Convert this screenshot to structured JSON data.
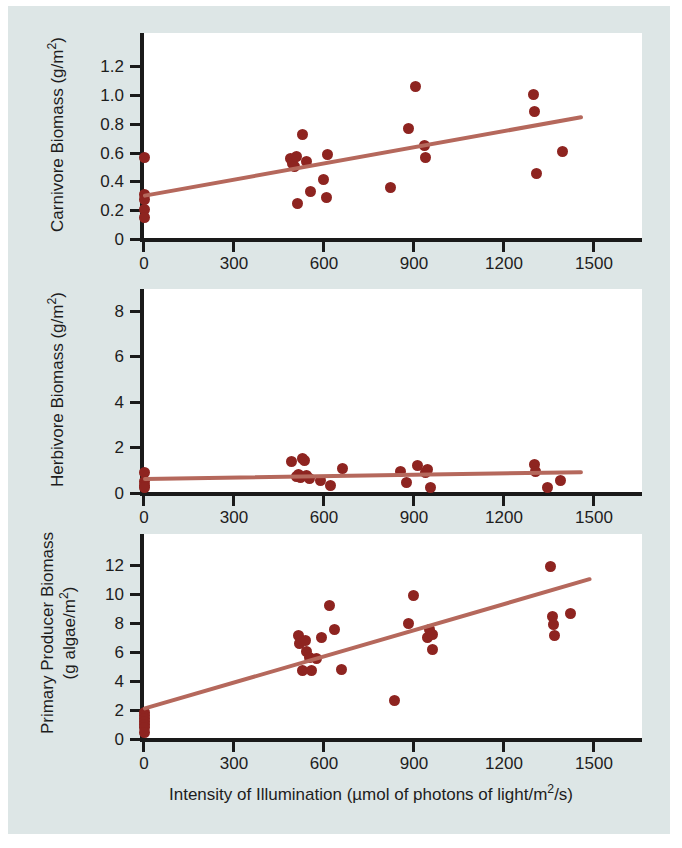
{
  "figure": {
    "background_color": "#dde6e6",
    "plot_background_color": "#ffffff",
    "point_color": "#8e2420",
    "line_color": "#b5685c",
    "axis_color": "#1a1a1a"
  },
  "xaxis": {
    "label_prefix": "Intensity of Illumination (",
    "label_mu": "µ",
    "label_mid": "mol of photons of light/m",
    "label_sup": "2",
    "label_suffix": "/s)",
    "full_label": "Intensity of Illumination (µmol of photons of light/m2/s)",
    "ticks": [
      "0",
      "300",
      "600",
      "900",
      "1200",
      "1500"
    ],
    "min": 0,
    "max": 1560
  },
  "chart_data": [
    {
      "type": "scatter",
      "panel": "top",
      "title": "",
      "ylabel_main": "Carnivore Biomass (g/m",
      "ylabel_sup": "2",
      "ylabel_end": ")",
      "ylabel": "Carnivore Biomass (g/m2)",
      "xlabel": "Intensity of Illumination (µmol of photons of light/m2/s)",
      "yticks": [
        "1.2",
        "1.0",
        "0.8",
        "0.6",
        "0.4",
        "0.2",
        "0"
      ],
      "ytickvals": [
        1.2,
        1.0,
        0.8,
        0.6,
        0.4,
        0.2,
        0
      ],
      "ylim": [
        0,
        1.3
      ],
      "xlim": [
        0,
        1560
      ],
      "grid": false,
      "legend": null,
      "points": [
        {
          "x": 5,
          "y": 0.56
        },
        {
          "x": 5,
          "y": 0.3
        },
        {
          "x": 5,
          "y": 0.27
        },
        {
          "x": 5,
          "y": 0.2
        },
        {
          "x": 5,
          "y": 0.14
        },
        {
          "x": 492,
          "y": 0.55
        },
        {
          "x": 500,
          "y": 0.52
        },
        {
          "x": 505,
          "y": 0.5
        },
        {
          "x": 512,
          "y": 0.57
        },
        {
          "x": 516,
          "y": 0.24
        },
        {
          "x": 532,
          "y": 0.72
        },
        {
          "x": 545,
          "y": 0.53
        },
        {
          "x": 560,
          "y": 0.32
        },
        {
          "x": 604,
          "y": 0.41
        },
        {
          "x": 612,
          "y": 0.28
        },
        {
          "x": 618,
          "y": 0.58
        },
        {
          "x": 828,
          "y": 0.35
        },
        {
          "x": 888,
          "y": 0.76
        },
        {
          "x": 910,
          "y": 1.05
        },
        {
          "x": 940,
          "y": 0.64
        },
        {
          "x": 944,
          "y": 0.56
        },
        {
          "x": 1305,
          "y": 1.0
        },
        {
          "x": 1310,
          "y": 0.88
        },
        {
          "x": 1315,
          "y": 0.45
        },
        {
          "x": 1402,
          "y": 0.6
        }
      ],
      "trendline": {
        "x1": 0,
        "y1": 0.29,
        "x2": 1470,
        "y2": 0.84
      }
    },
    {
      "type": "scatter",
      "panel": "middle",
      "title": "",
      "ylabel_main": "Herbivore Biomass (g/m",
      "ylabel_sup": "2",
      "ylabel_end": ")",
      "ylabel": "Herbivore Biomass (g/m2)",
      "xlabel": "Intensity of Illumination (µmol of photons of light/m2/s)",
      "yticks": [
        "8",
        "6",
        "4",
        "2",
        "0"
      ],
      "ytickvals": [
        8,
        6,
        4,
        2,
        0
      ],
      "ylim": [
        0,
        9.2
      ],
      "xlim": [
        0,
        1560
      ],
      "grid": false,
      "legend": null,
      "points": [
        {
          "x": 5,
          "y": 0.85
        },
        {
          "x": 5,
          "y": 0.45
        },
        {
          "x": 5,
          "y": 0.3
        },
        {
          "x": 5,
          "y": 0.18
        },
        {
          "x": 497,
          "y": 1.35
        },
        {
          "x": 512,
          "y": 0.7
        },
        {
          "x": 520,
          "y": 0.78
        },
        {
          "x": 528,
          "y": 0.65
        },
        {
          "x": 534,
          "y": 1.48
        },
        {
          "x": 540,
          "y": 1.4
        },
        {
          "x": 548,
          "y": 0.72
        },
        {
          "x": 556,
          "y": 0.6
        },
        {
          "x": 592,
          "y": 0.52
        },
        {
          "x": 625,
          "y": 0.3
        },
        {
          "x": 668,
          "y": 1.05
        },
        {
          "x": 862,
          "y": 0.88
        },
        {
          "x": 882,
          "y": 0.4
        },
        {
          "x": 918,
          "y": 1.15
        },
        {
          "x": 944,
          "y": 0.85
        },
        {
          "x": 952,
          "y": 1.0
        },
        {
          "x": 962,
          "y": 0.2
        },
        {
          "x": 1308,
          "y": 1.2
        },
        {
          "x": 1312,
          "y": 0.9
        },
        {
          "x": 1352,
          "y": 0.18
        },
        {
          "x": 1395,
          "y": 0.52
        }
      ],
      "trendline": {
        "x1": 0,
        "y1": 0.58,
        "x2": 1470,
        "y2": 0.88
      }
    },
    {
      "type": "scatter",
      "panel": "bottom",
      "title": "",
      "ylabel_line1": "Primary Producer Biomass",
      "ylabel_line2_main": "(g algae/m",
      "ylabel_sup": "2",
      "ylabel_end": ")",
      "ylabel": "Primary Producer Biomass (g algae/m2)",
      "xlabel": "Intensity of Illumination (µmol of photons of light/m2/s)",
      "yticks": [
        "12",
        "10",
        "8",
        "6",
        "4",
        "2",
        "0"
      ],
      "ytickvals": [
        12,
        10,
        8,
        6,
        4,
        2,
        0
      ],
      "ylim": [
        0,
        13.2
      ],
      "xlim": [
        0,
        1560
      ],
      "grid": false,
      "legend": null,
      "points": [
        {
          "x": 5,
          "y": 1.75
        },
        {
          "x": 5,
          "y": 1.55
        },
        {
          "x": 5,
          "y": 1.35
        },
        {
          "x": 5,
          "y": 1.15
        },
        {
          "x": 5,
          "y": 0.95
        },
        {
          "x": 5,
          "y": 0.75
        },
        {
          "x": 5,
          "y": 0.4
        },
        {
          "x": 518,
          "y": 7.05
        },
        {
          "x": 524,
          "y": 6.55
        },
        {
          "x": 532,
          "y": 4.65
        },
        {
          "x": 544,
          "y": 6.7
        },
        {
          "x": 548,
          "y": 5.95
        },
        {
          "x": 556,
          "y": 5.55
        },
        {
          "x": 562,
          "y": 4.65
        },
        {
          "x": 580,
          "y": 5.5
        },
        {
          "x": 598,
          "y": 6.95
        },
        {
          "x": 622,
          "y": 9.15
        },
        {
          "x": 640,
          "y": 7.5
        },
        {
          "x": 664,
          "y": 4.7
        },
        {
          "x": 840,
          "y": 2.6
        },
        {
          "x": 886,
          "y": 7.9
        },
        {
          "x": 904,
          "y": 9.85
        },
        {
          "x": 952,
          "y": 6.9
        },
        {
          "x": 958,
          "y": 7.5
        },
        {
          "x": 966,
          "y": 7.15
        },
        {
          "x": 968,
          "y": 6.1
        },
        {
          "x": 1362,
          "y": 11.8
        },
        {
          "x": 1368,
          "y": 8.35
        },
        {
          "x": 1372,
          "y": 7.85
        },
        {
          "x": 1376,
          "y": 7.05
        },
        {
          "x": 1428,
          "y": 8.6
        }
      ],
      "trendline": {
        "x1": 0,
        "y1": 2.0,
        "x2": 1500,
        "y2": 11.0
      }
    }
  ]
}
